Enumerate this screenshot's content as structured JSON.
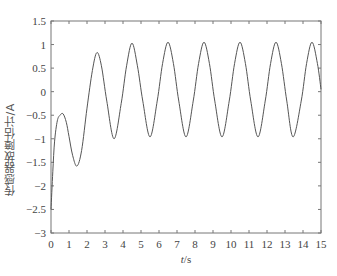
{
  "chart_data": {
    "type": "line",
    "title": "",
    "xlabel": "t/s",
    "ylabel": "传感器故障估计/A",
    "xlim": [
      0,
      15
    ],
    "ylim": [
      -3,
      1.5
    ],
    "xticks": [
      0,
      1,
      2,
      3,
      4,
      5,
      6,
      7,
      8,
      9,
      10,
      11,
      12,
      13,
      14,
      15
    ],
    "yticks": [
      1.5,
      1,
      0.5,
      0,
      -0.5,
      -1,
      -1.5,
      -2,
      -2.5,
      -3
    ],
    "ytick_labels": [
      "1.5",
      "1",
      "0.5",
      "0",
      "−0.5",
      "−1",
      "−1.5",
      "−2",
      "−2.5",
      "−3"
    ],
    "grid": false,
    "legend": null,
    "series": [
      {
        "name": "sensor fault estimate",
        "color": "#555555",
        "x": [
          0,
          0.1,
          0.2,
          0.35,
          0.5,
          0.67,
          0.85,
          1.0,
          1.2,
          1.44,
          1.7,
          2.0,
          2.3,
          2.55,
          2.8,
          3.1,
          3.5,
          3.9,
          4.2,
          4.5,
          4.8,
          5.1,
          5.5,
          5.9,
          6.2,
          6.5,
          6.8,
          7.1,
          7.5,
          7.9,
          8.2,
          8.5,
          8.8,
          9.1,
          9.5,
          9.9,
          10.2,
          10.5,
          10.8,
          11.1,
          11.5,
          11.9,
          12.2,
          12.5,
          12.8,
          13.1,
          13.45,
          13.9,
          14.2,
          14.5,
          14.8,
          15.0
        ],
        "y": [
          -2.5,
          -1.7,
          -1.05,
          -0.62,
          -0.5,
          -0.47,
          -0.65,
          -0.95,
          -1.35,
          -1.58,
          -1.25,
          -0.35,
          0.45,
          0.83,
          0.55,
          -0.2,
          -1.0,
          -0.25,
          0.55,
          1.03,
          0.55,
          -0.2,
          -0.96,
          -0.2,
          0.6,
          1.05,
          0.6,
          -0.2,
          -0.96,
          -0.2,
          0.6,
          1.05,
          0.6,
          -0.2,
          -0.96,
          -0.2,
          0.6,
          1.05,
          0.6,
          -0.2,
          -0.96,
          -0.2,
          0.6,
          1.05,
          0.6,
          -0.2,
          -0.96,
          -0.2,
          0.6,
          1.05,
          0.6,
          0.05
        ]
      }
    ]
  }
}
